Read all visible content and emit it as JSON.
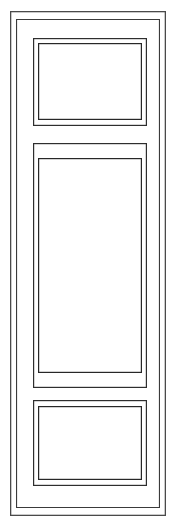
{
  "drawing": {
    "title": "Three Panel Door Elevation",
    "subject": "door",
    "view": "front-elevation",
    "style": "line-drawing",
    "background_color": "#ffffff",
    "line_color": "#2e2e2e",
    "fill_color": "#ffffff",
    "canvas": {
      "width": 175,
      "height": 526
    }
  },
  "door": {
    "name": "three-panel-door",
    "outer_edge": {
      "x": 10,
      "y": 11,
      "width": 156,
      "height": 505
    },
    "inner_edge": {
      "x": 16,
      "y": 19,
      "width": 144,
      "height": 489
    },
    "panel_count": 3
  },
  "panels": [
    {
      "id": "top-panel",
      "label": "Top Panel",
      "position": "top",
      "outer": {
        "x": 33,
        "y": 38,
        "width": 114,
        "height": 88
      },
      "inner": {
        "x": 38,
        "y": 43,
        "width": 104,
        "height": 77
      }
    },
    {
      "id": "middle-panel",
      "label": "Middle Panel",
      "position": "middle",
      "outer": {
        "x": 33,
        "y": 143,
        "width": 114,
        "height": 245
      },
      "inner": {
        "x": 38,
        "y": 158,
        "width": 104,
        "height": 215
      }
    },
    {
      "id": "bottom-panel",
      "label": "Bottom Panel",
      "position": "bottom",
      "outer": {
        "x": 33,
        "y": 400,
        "width": 114,
        "height": 86
      },
      "inner": {
        "x": 38,
        "y": 406,
        "width": 104,
        "height": 74
      }
    }
  ]
}
